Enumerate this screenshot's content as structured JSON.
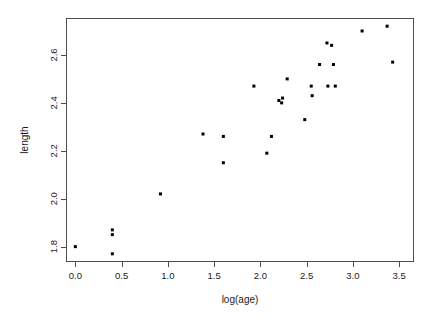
{
  "chart_data": {
    "type": "scatter",
    "title": "",
    "subtitle": "",
    "xlabel": "log(age)",
    "ylabel": "length",
    "xlim": [
      -0.09,
      3.65
    ],
    "ylim": [
      1.74,
      2.75
    ],
    "xticks": [
      "0.0",
      "0.5",
      "1.0",
      "1.5",
      "2.0",
      "2.5",
      "3.0",
      "3.5"
    ],
    "xtick_values": [
      0.0,
      0.5,
      1.0,
      1.5,
      2.0,
      2.5,
      3.0,
      3.5
    ],
    "yticks": [
      "1.8",
      "2.0",
      "2.2",
      "2.4",
      "2.6"
    ],
    "ytick_values": [
      1.8,
      2.0,
      2.2,
      2.4,
      2.6
    ],
    "grid": false,
    "legend": null,
    "legend_position": "none",
    "marker": "filled-square",
    "marker_color": "#000000",
    "marker_size": 3,
    "n_points": 27,
    "x": [
      0.0,
      0.4,
      0.4,
      0.4,
      0.92,
      1.38,
      1.6,
      1.6,
      1.93,
      2.07,
      2.12,
      2.2,
      2.23,
      2.24,
      2.29,
      2.48,
      2.55,
      2.56,
      2.64,
      2.72,
      2.73,
      2.77,
      2.79,
      2.81,
      3.1,
      3.37,
      3.43
    ],
    "y": [
      1.8,
      1.87,
      1.85,
      1.77,
      2.02,
      2.27,
      2.26,
      2.15,
      2.47,
      2.19,
      2.26,
      2.41,
      2.4,
      2.42,
      2.5,
      2.33,
      2.47,
      2.43,
      2.56,
      2.65,
      2.47,
      2.64,
      2.56,
      2.47,
      2.7,
      2.72,
      2.57
    ],
    "points": [
      {
        "x": 0.0,
        "y": 1.8
      },
      {
        "x": 0.4,
        "y": 1.87
      },
      {
        "x": 0.4,
        "y": 1.85
      },
      {
        "x": 0.4,
        "y": 1.77
      },
      {
        "x": 0.92,
        "y": 2.02
      },
      {
        "x": 1.38,
        "y": 2.27
      },
      {
        "x": 1.6,
        "y": 2.26
      },
      {
        "x": 1.6,
        "y": 2.15
      },
      {
        "x": 1.93,
        "y": 2.47
      },
      {
        "x": 2.07,
        "y": 2.19
      },
      {
        "x": 2.12,
        "y": 2.26
      },
      {
        "x": 2.2,
        "y": 2.41
      },
      {
        "x": 2.23,
        "y": 2.4
      },
      {
        "x": 2.24,
        "y": 2.42
      },
      {
        "x": 2.29,
        "y": 2.5
      },
      {
        "x": 2.48,
        "y": 2.33
      },
      {
        "x": 2.55,
        "y": 2.47
      },
      {
        "x": 2.56,
        "y": 2.43
      },
      {
        "x": 2.64,
        "y": 2.56
      },
      {
        "x": 2.72,
        "y": 2.65
      },
      {
        "x": 2.73,
        "y": 2.47
      },
      {
        "x": 2.77,
        "y": 2.64
      },
      {
        "x": 2.79,
        "y": 2.56
      },
      {
        "x": 2.81,
        "y": 2.47
      },
      {
        "x": 3.1,
        "y": 2.7
      },
      {
        "x": 3.37,
        "y": 2.72
      },
      {
        "x": 3.43,
        "y": 2.57
      }
    ]
  },
  "axes": {
    "frame_color": "#4d4d4d",
    "text_color": "#1a1a1a",
    "background": "#ffffff"
  }
}
